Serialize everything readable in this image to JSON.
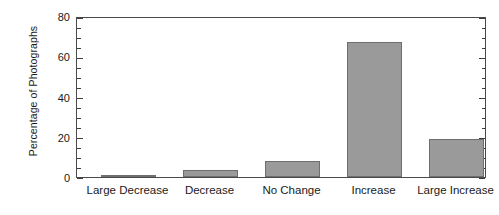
{
  "chart_data": {
    "type": "bar",
    "title": "",
    "subtitle": "",
    "xlabel": "",
    "ylabel": "Percentage of Photographs",
    "categories": [
      "Large Decrease",
      "Decrease",
      "No Change",
      "Increase",
      "Large Increase"
    ],
    "values": [
      0.5,
      3.5,
      8,
      67.5,
      19
    ],
    "ylim": [
      0,
      80
    ],
    "yticks": [
      0,
      20,
      40,
      60,
      80
    ],
    "ytick_labels": [
      "0",
      "20",
      "40",
      "60",
      "80"
    ],
    "y_minor_tick_step": 5,
    "grid": false,
    "legend": null,
    "legend_position": "none",
    "series": [
      {
        "name": "Percentage of Photographs",
        "values": [
          0.5,
          3.5,
          8,
          67.5,
          19
        ]
      }
    ],
    "annotations": [],
    "colors": {
      "bar_fill": "#9a9a9a",
      "bar_edge": "#6e6e6e",
      "axis": "#4a4a4a",
      "text": "#1a1a1a",
      "background": "#ffffff"
    }
  },
  "axis": {
    "y_title": "Percentage of Photographs",
    "tick_0": "0",
    "tick_20": "20",
    "tick_40": "40",
    "tick_60": "60",
    "tick_80": "80"
  },
  "categories": {
    "c0": "Large Decrease",
    "c1": "Decrease",
    "c2": "No Change",
    "c3": "Increase",
    "c4": "Large Increase"
  }
}
